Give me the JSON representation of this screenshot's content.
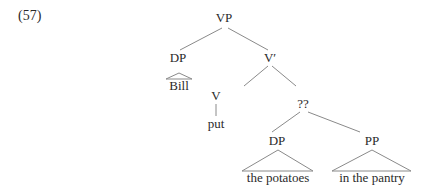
{
  "example_number": "(57)",
  "tree": {
    "root": "VP",
    "nodes": {
      "vp": "VP",
      "dp_subject": "DP",
      "bill": "Bill",
      "vbar": "V′",
      "v": "V",
      "put": "put",
      "unknown": "??",
      "dp_object": "DP",
      "the_potatoes": "the potatoes",
      "pp": "PP",
      "in_the_pantry": "in the pantry"
    }
  },
  "colors": {
    "line": "#8a8a8a",
    "text": "#2a2a2a"
  }
}
